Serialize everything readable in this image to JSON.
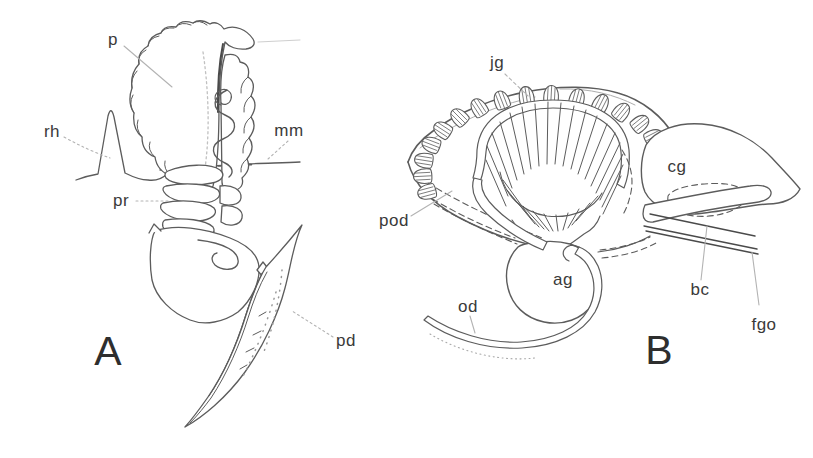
{
  "panels": {
    "a": {
      "letter": "A",
      "labels": {
        "p": "p",
        "rh": "rh",
        "mm": "mm",
        "pr": "pr",
        "pd": "pd"
      }
    },
    "b": {
      "letter": "B",
      "labels": {
        "jg": "jg",
        "pod": "pod",
        "cg": "cg",
        "ag": "ag",
        "od": "od",
        "bc": "bc",
        "fgo": "fgo"
      }
    }
  },
  "colors": {
    "background": "#ffffff",
    "drawing_line": "#5c5c5c",
    "label_text": "#3a3a3a",
    "leader_line": "#b3b3b3"
  }
}
